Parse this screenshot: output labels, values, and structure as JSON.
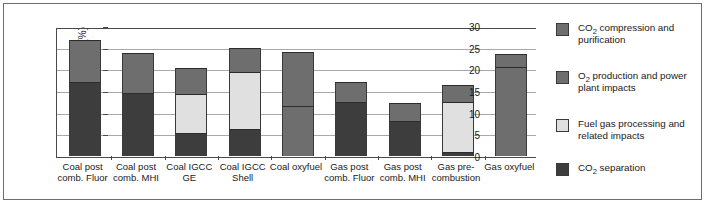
{
  "chart_data": {
    "type": "bar",
    "subtype": "stacked-vertical",
    "title": "",
    "xlabel": "",
    "ylabel": "Increase in fuel use (%)",
    "ylim": [
      0,
      30
    ],
    "ytick_step": 5,
    "yticks": [
      "0",
      "5",
      "10",
      "15",
      "20",
      "25",
      "30"
    ],
    "grid": true,
    "legend_position": "right",
    "categories": [
      "Coal post comb. Fluor",
      "Coal post comb. MHI",
      "Coal IGCC GE",
      "Coal IGCC Shell",
      "Coal oxyfuel",
      "Gas post comb. Fluor",
      "Gas post comb. MHI",
      "Gas pre-combustion",
      "Gas oxyfuel"
    ],
    "categories_lines": [
      [
        "Coal post",
        "comb. Fluor"
      ],
      [
        "Coal post",
        "comb. MHI"
      ],
      [
        "Coal IGCC",
        "GE"
      ],
      [
        "Coal IGCC",
        "Shell"
      ],
      [
        "Coal oxyfuel",
        ""
      ],
      [
        "Gas post",
        "comb. Fluor"
      ],
      [
        "Gas post",
        "comb. MHI"
      ],
      [
        "Gas pre-",
        "combustion"
      ],
      [
        "Gas oxyfuel",
        ""
      ]
    ],
    "series": [
      {
        "name": "CO2 separation",
        "color": "#3d3d3d",
        "values": [
          17.0,
          14.5,
          5.2,
          6.2,
          0.0,
          12.4,
          8.0,
          1.0,
          0.0
        ]
      },
      {
        "name": "Fuel gas processing and related impacts",
        "color": "#e0e0e0",
        "values": [
          0.0,
          0.0,
          9.0,
          13.3,
          0.0,
          0.0,
          0.0,
          11.5,
          0.0
        ]
      },
      {
        "name": "O2 production and power plant impacts",
        "color": "#6e6e6e",
        "values": [
          9.7,
          9.3,
          6.1,
          5.5,
          11.5,
          4.7,
          4.3,
          3.8,
          20.6
        ]
      },
      {
        "name": "CO2 compression and purification",
        "color": "#6e6e6e",
        "values": [
          0.0,
          0.0,
          0.0,
          0.0,
          12.4,
          0.0,
          0.0,
          0.0,
          2.9
        ]
      }
    ],
    "totals": [
      26.7,
      23.8,
      20.3,
      25.0,
      23.9,
      17.1,
      12.3,
      16.3,
      23.5
    ]
  },
  "legend": {
    "items": [
      {
        "id": "co2-compression-and-purification",
        "color": "#6e6e6e",
        "line1_pre": "CO",
        "line1_sub": "2",
        "line1_post": " compression and",
        "line2": "purification"
      },
      {
        "id": "o2-production-and-power-plant-impacts",
        "color": "#6e6e6e",
        "line1_pre": "O",
        "line1_sub": "2",
        "line1_post": " production and power",
        "line2": "plant impacts"
      },
      {
        "id": "fuel-gas-processing-and-related-impacts",
        "color": "#e0e0e0",
        "line1_pre": "Fuel gas processing and",
        "line1_sub": "",
        "line1_post": "",
        "line2": "related impacts"
      },
      {
        "id": "co2-separation",
        "color": "#3d3d3d",
        "line1_pre": "CO",
        "line1_sub": "2",
        "line1_post": " separation",
        "line2": ""
      }
    ]
  },
  "axis": {
    "y_title_pre": "Increase in fuel use (%)"
  }
}
